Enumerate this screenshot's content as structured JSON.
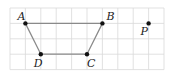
{
  "diagram": {
    "type": "grid-geometry",
    "grid": {
      "x0": 10,
      "y0": 8,
      "cols": 10,
      "rows": 4,
      "cell": 15.4
    },
    "points": [
      {
        "name": "A",
        "gx": 1,
        "gy": 1,
        "label_dx": -8,
        "label_dy": -3
      },
      {
        "name": "B",
        "gx": 6,
        "gy": 1,
        "label_dx": 4,
        "label_dy": -3
      },
      {
        "name": "C",
        "gx": 5,
        "gy": 3,
        "label_dx": 0,
        "label_dy": 13
      },
      {
        "name": "D",
        "gx": 2,
        "gy": 3,
        "label_dx": -7,
        "label_dy": 13
      },
      {
        "name": "P",
        "gx": 9,
        "gy": 1,
        "label_dx": -8,
        "label_dy": 12
      }
    ],
    "polygon": [
      "A",
      "B",
      "C",
      "D"
    ],
    "labels": {
      "A": "A",
      "B": "B",
      "C": "C",
      "D": "D",
      "P": "P"
    }
  }
}
